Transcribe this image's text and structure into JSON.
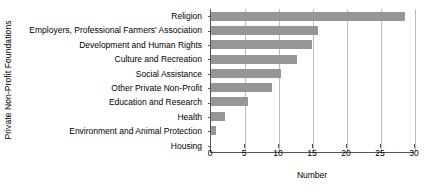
{
  "chart_data": {
    "type": "bar",
    "orientation": "horizontal",
    "title": "",
    "xlabel": "Number",
    "ylabel": "Private Non-Profit Foundations",
    "categories": [
      "Religion",
      "Employers, Professional Farmers' Association",
      "Development and Human Rights",
      "Culture and Recreation",
      "Social Assistance",
      "Other Private Non-Profit",
      "Education and Research",
      "Health",
      "Environment and Animal Protection",
      "Housing"
    ],
    "values": [
      28.5,
      15.8,
      14.8,
      12.7,
      10.3,
      9,
      5.5,
      2,
      0.7,
      0
    ],
    "xlim": [
      0,
      30
    ],
    "xticks": [
      0,
      5,
      10,
      15,
      20,
      25,
      30
    ],
    "xtick_labels": [
      "0",
      "5",
      "10",
      "15",
      "20",
      "25",
      "30"
    ],
    "grid": "vertical",
    "legend": "none",
    "bar_color": "#969696",
    "axis_color": "#555555",
    "grid_color": "#bdbdbd",
    "background_color": "#ffffff"
  }
}
